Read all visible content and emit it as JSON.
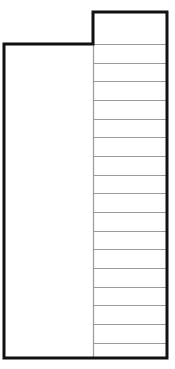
{
  "diagram": {
    "type": "wireframe-layout",
    "canvas": {
      "width": 175,
      "height": 369
    },
    "colors": {
      "background": "#ffffff",
      "outline": "#111111",
      "row_divider": "#9a9a9a",
      "column_divider": "#9a9a9a"
    },
    "left_panel": {
      "x": 4,
      "top": 44,
      "right": 93,
      "bottom": 358
    },
    "right_column": {
      "left": 93,
      "right": 167,
      "top": 12,
      "bottom": 358,
      "row_lines_y": [
        44,
        63,
        81,
        100,
        119,
        137,
        156,
        175,
        193,
        212,
        231,
        249,
        268,
        287,
        305,
        324,
        343
      ],
      "row_count": 18
    }
  }
}
